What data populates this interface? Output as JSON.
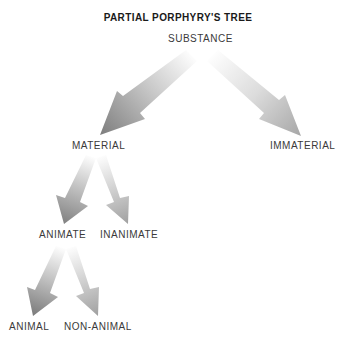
{
  "title": "PARTIAL PORPHYRY'S TREE",
  "nodes": {
    "substance": "SUBSTANCE",
    "material": "MATERIAL",
    "immaterial": "IMMATERIAL",
    "animate": "ANIMATE",
    "inanimate": "INANIMATE",
    "animal": "ANIMAL",
    "non_animal": "NON-ANIMAL"
  },
  "edges": [
    {
      "from": "SUBSTANCE",
      "to": "MATERIAL"
    },
    {
      "from": "SUBSTANCE",
      "to": "IMMATERIAL"
    },
    {
      "from": "MATERIAL",
      "to": "ANIMATE"
    },
    {
      "from": "MATERIAL",
      "to": "INANIMATE"
    },
    {
      "from": "ANIMATE",
      "to": "ANIMAL"
    },
    {
      "from": "ANIMATE",
      "to": "NON-ANIMAL"
    }
  ],
  "colors": {
    "arrow_dark": "#7a7a7a",
    "arrow_light": "#b0b0b0",
    "text": "#3a3a3a",
    "title": "#1a1a1a"
  }
}
